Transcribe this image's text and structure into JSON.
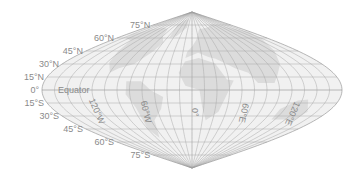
{
  "map": {
    "projection": "sinusoidal",
    "colors": {
      "ocean": "#f1f1f1",
      "land": "#dcdcdc",
      "graticule": "#a8a8a8",
      "outline": "#9a9a9a",
      "label": "#8a8a8a"
    },
    "graticule_step_deg": 15,
    "latitude_labels": [
      {
        "lat": 75,
        "text": "75°N"
      },
      {
        "lat": 60,
        "text": "60°N"
      },
      {
        "lat": 45,
        "text": "45°N"
      },
      {
        "lat": 30,
        "text": "30°N"
      },
      {
        "lat": 15,
        "text": "15°N"
      },
      {
        "lat": 0,
        "text": "0°"
      },
      {
        "lat": -15,
        "text": "15°S"
      },
      {
        "lat": -30,
        "text": "30°S"
      },
      {
        "lat": -45,
        "text": "45°S"
      },
      {
        "lat": -60,
        "text": "60°S"
      },
      {
        "lat": -75,
        "text": "75°S"
      }
    ],
    "equator_label": "Equator",
    "longitude_labels": [
      {
        "lon": -120,
        "text": "120°W"
      },
      {
        "lon": -60,
        "text": "60°W"
      },
      {
        "lon": 0,
        "text": "0°"
      },
      {
        "lon": 60,
        "text": "60°E"
      },
      {
        "lon": 120,
        "text": "120°E"
      }
    ]
  }
}
